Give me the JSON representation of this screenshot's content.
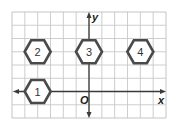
{
  "grid": {
    "cols": 12,
    "rows": 8,
    "x_min": -6,
    "x_max": 6,
    "y_min": -2,
    "y_max": 6,
    "line_color": "#c8c8c8",
    "border_color": "#bdbdbd"
  },
  "axes": {
    "x_label": "x",
    "y_label": "y",
    "origin_label": "O",
    "color": "#3a3a3a"
  },
  "shapes": [
    {
      "type": "hexagon",
      "label": "1",
      "center": [
        -4,
        0
      ]
    },
    {
      "type": "hexagon",
      "label": "2",
      "center": [
        -4,
        3
      ]
    },
    {
      "type": "hexagon",
      "label": "3",
      "center": [
        0,
        3
      ]
    },
    {
      "type": "hexagon",
      "label": "4",
      "center": [
        4,
        3
      ]
    }
  ],
  "shape_style": {
    "stroke": "#4a4a4a",
    "fill": "#ffffff"
  }
}
